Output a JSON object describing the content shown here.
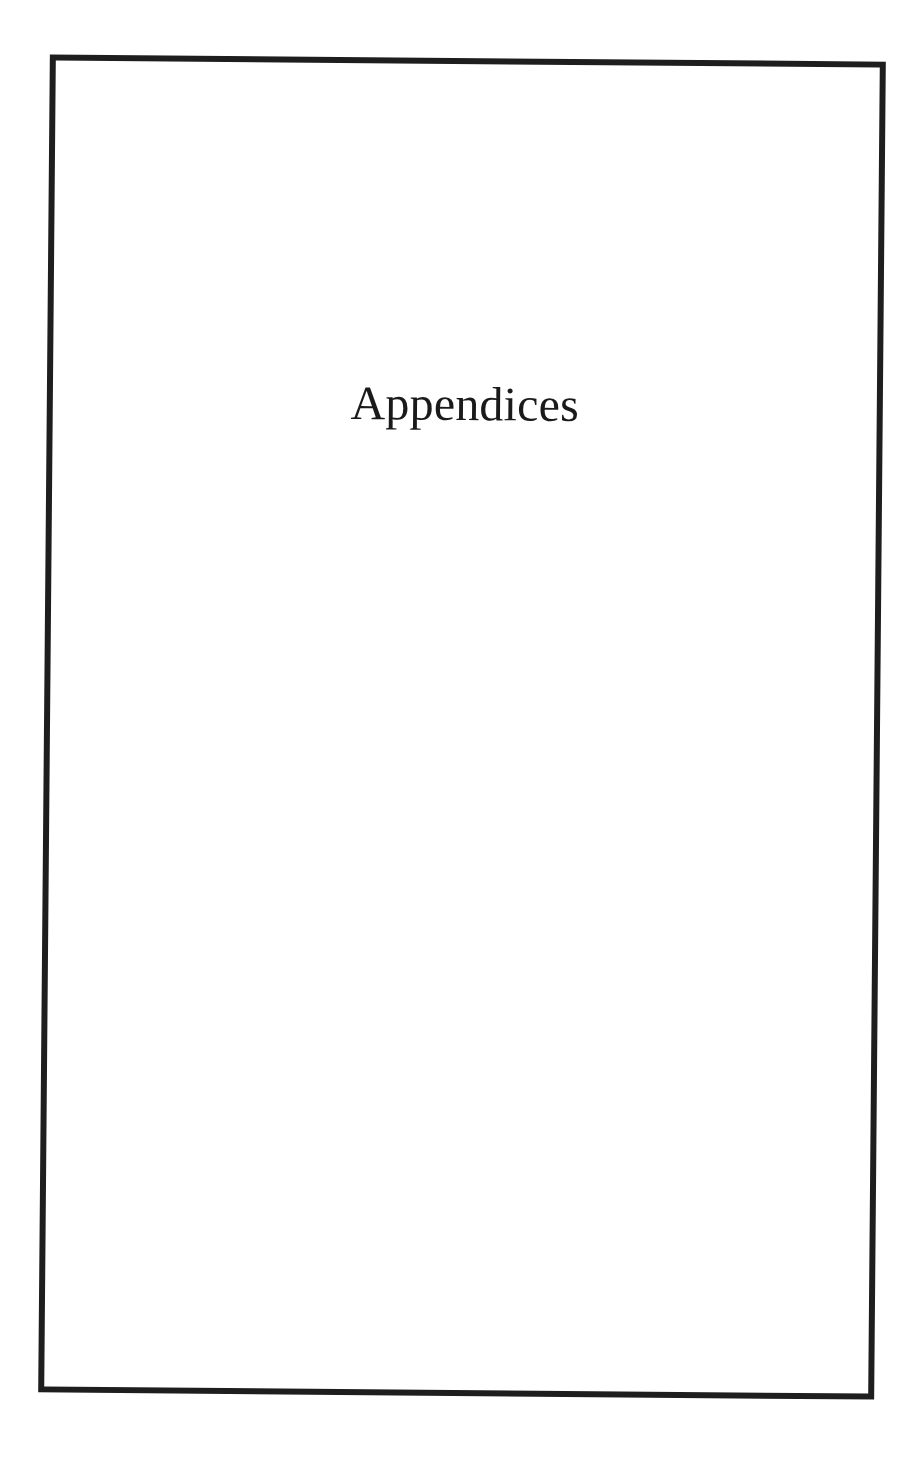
{
  "page": {
    "title": "Appendices"
  },
  "colors": {
    "border": "#1e1e1e",
    "text": "#1a1a1a",
    "background": "#ffffff"
  }
}
